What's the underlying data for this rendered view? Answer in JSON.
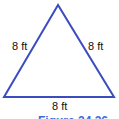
{
  "figure": {
    "shape": "equilateral-triangle",
    "stroke_color": "#3b4cc0",
    "side_labels": {
      "left": "8 ft",
      "right": "8 ft",
      "bottom": "8 ft"
    },
    "caption": "Figure 24.26"
  }
}
